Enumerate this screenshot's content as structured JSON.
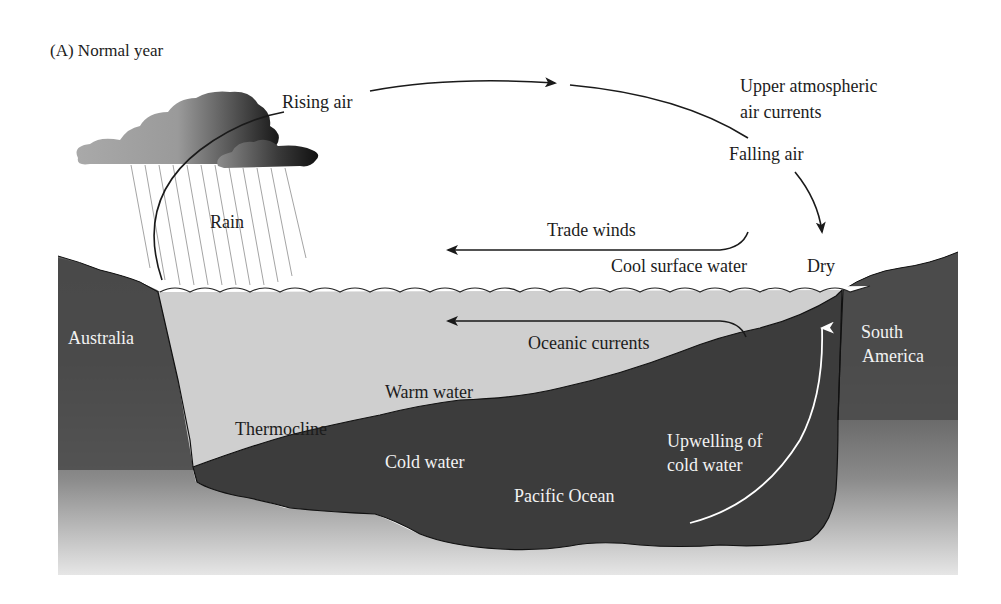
{
  "title": "(A)  Normal year",
  "colors": {
    "land": "#4a4a4a",
    "cold_water": "#3c3c3c",
    "warm_water": "#cfcfcf",
    "cloud_light": "#a6a6a6",
    "cloud_dark": "#1e1e1e",
    "arrow": "#1a1a1a",
    "upwelling_arrow": "#ffffff"
  },
  "atmosphere": {
    "rising_air": "Rising air",
    "upper_currents_line1": "Upper atmospheric",
    "upper_currents_line2": "air currents",
    "falling_air": "Falling air",
    "rain": "Rain",
    "trade_winds": "Trade winds",
    "dry": "Dry"
  },
  "ocean": {
    "cool_surface_water": "Cool surface water",
    "oceanic_currents": "Oceanic currents",
    "warm_water": "Warm water",
    "thermocline": "Thermocline",
    "cold_water": "Cold water",
    "pacific_ocean": "Pacific Ocean",
    "upwelling_line1": "Upwelling of",
    "upwelling_line2": "cold water"
  },
  "land": {
    "australia": "Australia",
    "south_america_line1": "South",
    "south_america_line2": "America"
  }
}
